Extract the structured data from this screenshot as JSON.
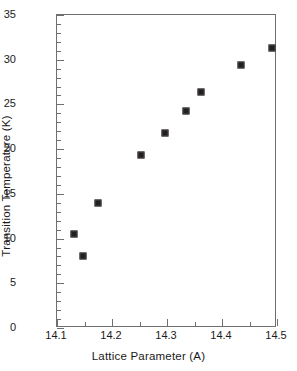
{
  "chart_data": {
    "type": "scatter",
    "title": "",
    "xlabel": "Lattice Parameter (A)",
    "ylabel": "Transition Temperature (K)",
    "xlim": [
      14.1,
      14.5
    ],
    "ylim": [
      0,
      35
    ],
    "grid": false,
    "legend": null,
    "x_major_ticks": [
      14.1,
      14.2,
      14.3,
      14.4,
      14.5
    ],
    "x_major_tick_labels": [
      "14.1",
      "14.2",
      "14.3",
      "14.4",
      "14.5"
    ],
    "x_minor_tick_interval": 0.05,
    "y_major_ticks": [
      0,
      5,
      10,
      15,
      20,
      25,
      30,
      35
    ],
    "y_major_tick_labels": [
      "0",
      "5",
      "10",
      "15",
      "20",
      "25",
      "30",
      "35"
    ],
    "y_minor_tick_interval": 1,
    "marker": "filled-square",
    "marker_color": "#231f20",
    "points": [
      {
        "x": 14.13,
        "y": 10.5
      },
      {
        "x": 14.148,
        "y": 8.0
      },
      {
        "x": 14.175,
        "y": 14.0
      },
      {
        "x": 14.252,
        "y": 19.3
      },
      {
        "x": 14.297,
        "y": 21.8
      },
      {
        "x": 14.334,
        "y": 24.3
      },
      {
        "x": 14.361,
        "y": 26.4
      },
      {
        "x": 14.434,
        "y": 29.4
      },
      {
        "x": 14.49,
        "y": 31.3
      }
    ]
  },
  "colors": {
    "axis": "#6e6e73",
    "marker": "#231f20",
    "text": "#1a1a1a",
    "background": "#ffffff"
  }
}
